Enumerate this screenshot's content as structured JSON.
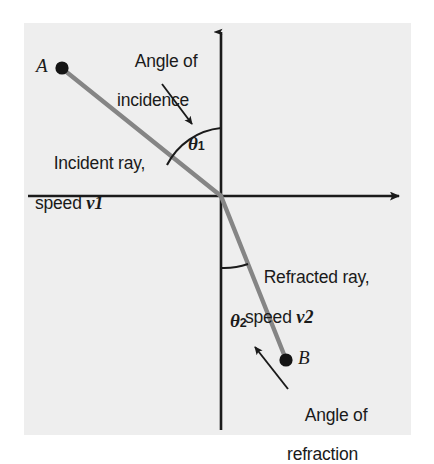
{
  "figure": {
    "background_color": "#eeeeee",
    "page_background": "#ffffff",
    "ray_color": "#808080",
    "axis_color": "#1a1a1a",
    "text_color": "#1a1a1a"
  },
  "points": [
    {
      "id": "A",
      "label": "A",
      "x": 62,
      "y": 68,
      "description": "source point of incident ray"
    },
    {
      "id": "B",
      "label": "B",
      "x": 286,
      "y": 360,
      "description": "end point of refracted ray"
    }
  ],
  "angles": {
    "theta1": {
      "symbol": "θ",
      "subscript": "1",
      "name": "angle of incidence"
    },
    "theta2": {
      "symbol": "θ",
      "subscript": "2",
      "name": "angle of refraction"
    }
  },
  "labels": {
    "angle_of_incidence": {
      "line1": "Angle of",
      "line2": "incidence"
    },
    "angle_of_refraction": {
      "line1": "Angle of",
      "line2": "refraction"
    },
    "incident_ray": {
      "line1": "Incident ray,",
      "line2_prefix": "speed ",
      "speed_symbol": "v",
      "speed_subscript": "1"
    },
    "refracted_ray": {
      "line1": "Refracted ray,",
      "line2_prefix": "speed ",
      "speed_symbol": "v",
      "speed_subscript": "2"
    }
  },
  "geometry": {
    "origin": {
      "x": 221,
      "y": 196
    },
    "vertical_axis": {
      "x": 221,
      "top_y": 28,
      "bottom_y": 430,
      "arrow": "up"
    },
    "horizontal_axis": {
      "y": 196,
      "left_x": 28,
      "right_x": 406,
      "arrow": "right"
    },
    "incident_ray": {
      "from": {
        "x": 62,
        "y": 68
      },
      "to": {
        "x": 221,
        "y": 196
      }
    },
    "refracted_ray": {
      "from": {
        "x": 221,
        "y": 196
      },
      "to": {
        "x": 286,
        "y": 360
      }
    },
    "theta1_arc": {
      "radius": 68,
      "from_deg": 90,
      "to_deg": 141
    },
    "theta2_arc": {
      "radius": 72,
      "from_deg": 270,
      "to_deg": 248
    }
  }
}
